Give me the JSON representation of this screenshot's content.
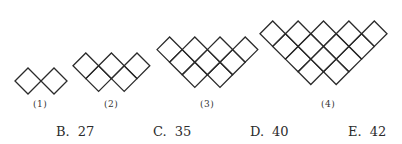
{
  "figures": [
    {
      "label": "(1)",
      "rows": [
        2
      ]
    },
    {
      "label": "(2)",
      "rows": [
        3,
        2
      ]
    },
    {
      "label": "(3)",
      "rows": [
        4,
        3,
        2
      ]
    },
    {
      "label": "(4)",
      "rows": [
        5,
        4,
        3,
        2
      ]
    }
  ],
  "options": [
    {
      "letter": "B.",
      "value": "27"
    },
    {
      "letter": "C.",
      "value": "35"
    },
    {
      "letter": "D.",
      "value": "40"
    },
    {
      "letter": "E.",
      "value": "42"
    }
  ],
  "colors": {
    "stroke": "#2a2a2a",
    "background": "#ffffff"
  }
}
